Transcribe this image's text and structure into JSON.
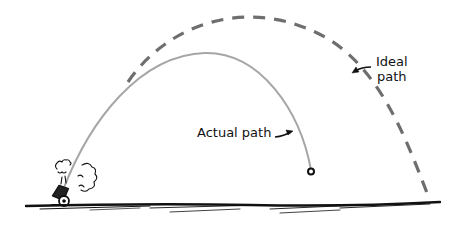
{
  "diagram": {
    "type": "projectile-trajectory-sketch",
    "labels": {
      "actual": "Actual path",
      "ideal_line1": "Ideal",
      "ideal_line2": "path"
    },
    "elements": [
      {
        "name": "cannon",
        "description": "small cartoon cannon on the ground at left, tilted up-right, with smoke puffs"
      },
      {
        "name": "actual-path",
        "style": "solid gray curve",
        "description": "shorter, lower arc ending at a small dot (impact point)"
      },
      {
        "name": "ideal-path",
        "style": "dashed gray curve",
        "description": "taller, longer arc landing far right on the ground"
      },
      {
        "name": "ground",
        "style": "sketchy black line"
      }
    ],
    "colors": {
      "actual_path": "#a6a6a6",
      "ideal_path": "#6e6e6e",
      "ink": "#111111",
      "background": "#ffffff"
    }
  }
}
